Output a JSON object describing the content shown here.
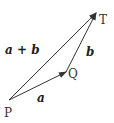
{
  "diagram": {
    "type": "vector-addition",
    "points": {
      "P": {
        "label": "P",
        "x": 9,
        "y": 100
      },
      "Q": {
        "label": "Q",
        "x": 66,
        "y": 72
      },
      "T": {
        "label": "T",
        "x": 96,
        "y": 13
      }
    },
    "vectors": [
      {
        "from": "P",
        "to": "Q",
        "label": "a"
      },
      {
        "from": "Q",
        "to": "T",
        "label": "b"
      },
      {
        "from": "P",
        "to": "T",
        "label": "a + b"
      }
    ],
    "colors": {
      "line": "#333333",
      "text": "#333333"
    }
  }
}
